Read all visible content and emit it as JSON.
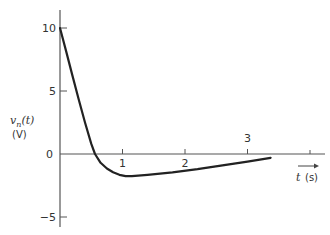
{
  "chart_data": {
    "type": "line",
    "title": "",
    "xlabel": "t (s)",
    "ylabel": "v_n(t) (V)",
    "ylabel_line1": "v",
    "ylabel_sub": "n",
    "ylabel_rest": "(t)",
    "ylabel_unit": "(V)",
    "xlabel_var": "t",
    "xlabel_unit": "(s)",
    "xlim": [
      0,
      3.5
    ],
    "ylim": [
      -6,
      11.5
    ],
    "grid": false,
    "legend": null,
    "x_ticks": [
      {
        "value": 1,
        "label": "1"
      },
      {
        "value": 2,
        "label": "2"
      },
      {
        "value": 3,
        "label": "3"
      }
    ],
    "y_ticks": [
      {
        "value": 10,
        "label": "10"
      },
      {
        "value": 5,
        "label": "5"
      },
      {
        "value": 0,
        "label": "0"
      },
      {
        "value": -5,
        "label": "−5"
      }
    ],
    "series": [
      {
        "name": "v_n(t)",
        "x": [
          0,
          0.1,
          0.2,
          0.3,
          0.4,
          0.5,
          0.56,
          0.65,
          0.75,
          0.85,
          0.95,
          1.05,
          1.15,
          1.4,
          1.8,
          2.2,
          2.6,
          3.0,
          3.37
        ],
        "y": [
          10,
          8.1,
          6.2,
          4.3,
          2.5,
          0.8,
          0,
          -0.7,
          -1.15,
          -1.45,
          -1.65,
          -1.75,
          -1.75,
          -1.65,
          -1.45,
          -1.2,
          -0.9,
          -0.6,
          -0.3
        ]
      }
    ]
  }
}
